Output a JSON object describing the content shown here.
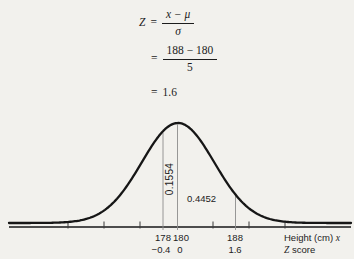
{
  "page": {
    "background": "#f2f1ed",
    "ink": "#1c1c1c"
  },
  "formula": {
    "line1": {
      "lhs": "Z",
      "equals": "=",
      "numerator": "x − μ",
      "denominator": "σ"
    },
    "line2": {
      "equals": "=",
      "numerator": "188 − 180",
      "denominator": "5"
    },
    "line3": {
      "equals": "=",
      "result": "1.6"
    }
  },
  "plot": {
    "area_label_vertical": "0.1554",
    "area_label_horizontal": "0.4452",
    "tick_labels_x": [
      "178",
      "180",
      "188"
    ],
    "tick_labels_z": [
      "−0.4",
      "0",
      "1.6"
    ],
    "x_axis_label": "Height (cm)",
    "x_axis_var": "x",
    "z_axis_var": "Z",
    "z_axis_label": "score"
  },
  "chart_data": {
    "type": "area",
    "curve": "normal-distribution-density",
    "mean": 180,
    "sd": 5,
    "x_axis": {
      "label": "Height (cm) x",
      "secondary_label": "Z score",
      "marked_x_values": [
        178,
        180,
        188
      ],
      "marked_z_values": [
        -0.4,
        0,
        1.6
      ],
      "unlabeled_tick_values": [
        165,
        170,
        175,
        185,
        190,
        195
      ]
    },
    "vertical_guides_at_x": [
      178,
      180,
      188
    ],
    "shaded_regions": [
      {
        "x_from": 178,
        "x_to": 180,
        "z_from": -0.4,
        "z_to": 0,
        "area": 0.1554
      },
      {
        "x_from": 180,
        "x_to": 188,
        "z_from": 0,
        "z_to": 1.6,
        "area": 0.4452
      }
    ],
    "annotations": [
      "0.1554",
      "0.4452"
    ],
    "formula_steps": [
      "Z = (x − μ)/σ",
      "= (188 − 180)/5",
      "= 1.6"
    ],
    "legend": "off",
    "grid": "off"
  }
}
